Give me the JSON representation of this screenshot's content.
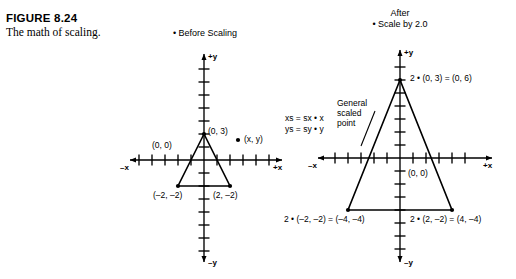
{
  "figure": {
    "number": "FIGURE 8.24",
    "caption": "The math of scaling."
  },
  "panels": {
    "before": {
      "heading": "• Before Scaling",
      "labels": {
        "apex": "(0, 3)",
        "origin": "(0, 0)",
        "bottom_left": "(–2, –2)",
        "bottom_right": "(2, –2)",
        "point": "(x, y)"
      },
      "axes": {
        "pos_y": "+y",
        "neg_y": "–y",
        "pos_x": "+x",
        "neg_x": "–x"
      }
    },
    "after": {
      "heading_line1": "After",
      "heading_line2": "• Scale by 2.0",
      "labels": {
        "apex": "2 • (0, 3) = (0, 6)",
        "origin": "(0, 0)",
        "bottom_left": "2 • (–2, –2) = (–4, –4)",
        "bottom_right": "2 • (2, –2) = (4, –4)"
      },
      "axes": {
        "pos_y": "+y",
        "neg_y": "–y",
        "pos_x": "+x",
        "neg_x": "–x"
      }
    }
  },
  "formulas": {
    "line1": "xs = sx • x",
    "line2": "ys = sy • y"
  },
  "callout": {
    "line1": "General",
    "line2": "scaled",
    "line3": "point"
  },
  "colors": {
    "ink": "#000000",
    "background": "#ffffff"
  }
}
